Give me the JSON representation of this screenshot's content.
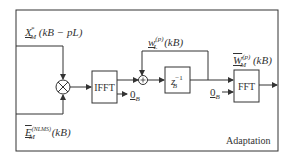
{
  "diagram": {
    "title": "Adaptation",
    "inputs": {
      "x_signal": {
        "base": "X",
        "sup": "*",
        "sub": "M",
        "arg": "(kB − pL)"
      },
      "e_signal": {
        "base": "E",
        "sup": "(NLMS)",
        "sub": "M",
        "arg": "(kB)"
      }
    },
    "blocks": {
      "multiplier": "⊗",
      "ifft": "IFFT",
      "adder": "+",
      "delay": {
        "base": "z",
        "sub": "B",
        "sup": "−1"
      },
      "fft": "FFT"
    },
    "signals": {
      "w_time": {
        "base": "w",
        "sup": "(p)",
        "sub": "L",
        "arg": "(kB)"
      },
      "W_freq": {
        "base": "W",
        "sup": "(p)",
        "sub": "M",
        "arg": "(kB)"
      },
      "zero_ifft": {
        "base": "0",
        "sub": "B"
      },
      "zero_fft": {
        "base": "0",
        "sub": "B"
      }
    }
  }
}
